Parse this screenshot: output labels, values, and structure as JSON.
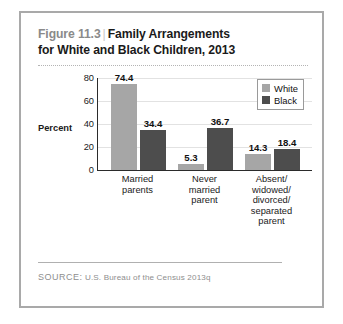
{
  "figure": {
    "number": "Figure 11.3",
    "separator": "|",
    "title": "Family Arrangements for White and Black Children, 2013",
    "title_line_1": "Family Arrangements",
    "title_line_2": "for White and Black Children, 2013"
  },
  "source": {
    "label": "SOURCE:",
    "text": "U.S. Bureau of the Census 2013q"
  },
  "legend": {
    "position": "top-right",
    "entries": [
      {
        "label": "White",
        "color": "#a6a6a6"
      },
      {
        "label": "Black",
        "color": "#4d4d4d"
      }
    ]
  },
  "axis": {
    "y_title": "Percent",
    "y_ticks": [
      "0",
      "20",
      "40",
      "60",
      "80"
    ]
  },
  "chart_data": {
    "type": "bar",
    "title": "Family Arrangements for White and Black Children, 2013",
    "xlabel": "",
    "ylabel": "Percent",
    "ylim": [
      0,
      80
    ],
    "yticks": [
      0,
      20,
      40,
      60,
      80
    ],
    "grid": true,
    "legend_position": "top-right",
    "categories": [
      "Married parents",
      "Never married parent",
      "Absent/ widowed/ divorced/ separated parent"
    ],
    "category_lines": [
      [
        "Married",
        "parents"
      ],
      [
        "Never",
        "married",
        "parent"
      ],
      [
        "Absent/",
        "widowed/",
        "divorced/",
        "separated",
        "parent"
      ]
    ],
    "series": [
      {
        "name": "White",
        "color": "#a6a6a6",
        "values": [
          74.4,
          5.3,
          14.3
        ],
        "labels": [
          "74.4",
          "5.3",
          "14.3"
        ]
      },
      {
        "name": "Black",
        "color": "#4d4d4d",
        "values": [
          34.4,
          36.7,
          18.4
        ],
        "labels": [
          "34.4",
          "36.7",
          "18.4"
        ]
      }
    ]
  }
}
